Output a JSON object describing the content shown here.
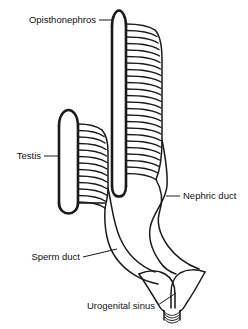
{
  "figure": {
    "background_color": "#ffffff",
    "ink_color": "#1a1a1a",
    "width": 248,
    "height": 329
  },
  "labels": {
    "opisthonephros": "Opisthonephros",
    "testis": "Testis",
    "nephric_duct": "Nephric duct",
    "sperm_duct": "Sperm duct",
    "urogenital_sinus": "Urogenital sinus"
  },
  "structures": [
    {
      "name": "right-opisthonephros",
      "label": "Opisthonephros",
      "tubule_count": 24,
      "top_y": 10,
      "bottom_y": 187
    },
    {
      "name": "left-opisthonephros-testis",
      "label": "Testis",
      "tubule_count": 14,
      "top_y": 110,
      "bottom_y": 213
    },
    {
      "name": "nephric-duct",
      "label": "Nephric duct"
    },
    {
      "name": "sperm-duct",
      "label": "Sperm duct"
    },
    {
      "name": "urogenital-sinus",
      "label": "Urogenital sinus",
      "rim_lines": 4
    }
  ]
}
